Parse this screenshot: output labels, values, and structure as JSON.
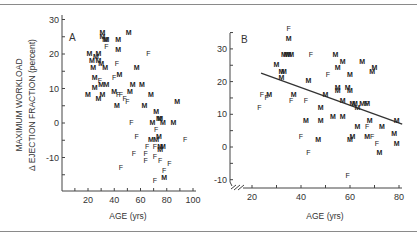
{
  "chart_data": [
    {
      "type": "scatter",
      "panel": "A",
      "xlabel": "AGE (yrs)",
      "ylabel": "MAXIMUM WORKLOAD Δ EJECTION FRACTION (percent)",
      "xlim": [
        0,
        100
      ],
      "ylim": [
        -20,
        30
      ],
      "xticks": [
        20,
        40,
        60,
        80,
        100
      ],
      "yticks": [
        30,
        20,
        10,
        0,
        -10
      ],
      "grid": false,
      "legend": "point markers: M = male, F = female",
      "series": [
        {
          "name": "M",
          "points": [
            [
              31,
              26
            ],
            [
              31,
              25
            ],
            [
              33,
              24
            ],
            [
              34,
              24
            ],
            [
              43,
              24
            ],
            [
              51,
              26
            ],
            [
              21,
              20
            ],
            [
              28,
              20
            ],
            [
              43,
              21
            ],
            [
              23,
              18
            ],
            [
              26,
              19
            ],
            [
              28,
              18
            ],
            [
              30,
              17
            ],
            [
              24,
              16
            ],
            [
              33,
              16
            ],
            [
              25,
              13
            ],
            [
              57,
              16
            ],
            [
              44,
              14
            ],
            [
              30,
              11
            ],
            [
              34,
              11
            ],
            [
              25,
              10
            ],
            [
              20,
              8
            ],
            [
              28,
              7
            ],
            [
              31,
              8
            ],
            [
              54,
              11
            ],
            [
              61,
              11
            ],
            [
              52,
              9
            ],
            [
              40,
              9
            ],
            [
              42,
              5
            ],
            [
              63,
              5
            ],
            [
              68,
              8
            ],
            [
              88,
              6
            ],
            [
              72,
              3
            ],
            [
              74,
              1
            ],
            [
              75,
              1
            ],
            [
              69,
              0
            ],
            [
              77,
              0
            ],
            [
              85,
              0
            ],
            [
              74,
              -4
            ],
            [
              68,
              -5
            ],
            [
              72,
              -5
            ],
            [
              75,
              -7
            ],
            [
              77,
              -7
            ],
            [
              75,
              -8
            ],
            [
              78,
              -16
            ]
          ]
        },
        {
          "name": "F",
          "points": [
            [
              34,
              22
            ],
            [
              66,
              20
            ],
            [
              42,
              17
            ],
            [
              40,
              13
            ],
            [
              29,
              12
            ],
            [
              43,
              8
            ],
            [
              45,
              8
            ],
            [
              48,
              7
            ],
            [
              50,
              6
            ],
            [
              53,
              0
            ],
            [
              72,
              -2
            ],
            [
              57,
              -4
            ],
            [
              94,
              -5
            ],
            [
              65,
              -7
            ],
            [
              71,
              -7
            ],
            [
              55,
              -9
            ],
            [
              64,
              -9
            ],
            [
              71,
              -10
            ],
            [
              64,
              -11
            ],
            [
              75,
              -11
            ],
            [
              82,
              -12
            ],
            [
              45,
              -13
            ],
            [
              78,
              -14
            ],
            [
              71,
              -17
            ]
          ]
        }
      ],
      "annotations": [
        "A"
      ]
    },
    {
      "type": "scatter",
      "panel": "B",
      "xlabel": "AGE (yrs)",
      "ylabel": "",
      "xlim": [
        10,
        80
      ],
      "ylim": [
        -10,
        35
      ],
      "xticks": [
        20,
        40,
        60,
        80
      ],
      "yticks": [
        30,
        20,
        10,
        0,
        -10
      ],
      "grid": false,
      "axis_break": true,
      "series": [
        {
          "name": "M",
          "points": [
            [
              35,
              33
            ],
            [
              33,
              28
            ],
            [
              34,
              28
            ],
            [
              35,
              28
            ],
            [
              36,
              28
            ],
            [
              30,
              25
            ],
            [
              32,
              23
            ],
            [
              33,
              23
            ],
            [
              32,
              21
            ],
            [
              37,
              16
            ],
            [
              27,
              16
            ],
            [
              43,
              20
            ],
            [
              54,
              28
            ],
            [
              55,
              24
            ],
            [
              57,
              26
            ],
            [
              65,
              26
            ],
            [
              70,
              24
            ],
            [
              69,
              23
            ],
            [
              60,
              22
            ],
            [
              50,
              16
            ],
            [
              55,
              18
            ],
            [
              55,
              17
            ],
            [
              59,
              18
            ],
            [
              60,
              17
            ],
            [
              57,
              14
            ],
            [
              61,
              13
            ],
            [
              62,
              13
            ],
            [
              63,
              12
            ],
            [
              65,
              13
            ],
            [
              67,
              13
            ],
            [
              42,
              8
            ],
            [
              48,
              12
            ],
            [
              48,
              8
            ],
            [
              53,
              9
            ],
            [
              57,
              9
            ],
            [
              68,
              8
            ],
            [
              79,
              8
            ],
            [
              63,
              6
            ],
            [
              73,
              6
            ],
            [
              61,
              3
            ],
            [
              60,
              2
            ],
            [
              67,
              3
            ],
            [
              78,
              4
            ],
            [
              47,
              2
            ],
            [
              79,
              1
            ],
            [
              72,
              -2
            ]
          ]
        },
        {
          "name": "F",
          "points": [
            [
              35,
              36
            ],
            [
              44,
              28
            ],
            [
              24,
              16
            ],
            [
              26,
              15
            ],
            [
              23,
              12
            ],
            [
              36,
              14
            ],
            [
              42,
              14
            ],
            [
              51,
              22
            ],
            [
              67,
              13
            ],
            [
              67,
              6
            ],
            [
              69,
              3
            ],
            [
              71,
              1
            ],
            [
              40,
              3
            ],
            [
              43,
              -2
            ],
            [
              59,
              -9
            ]
          ]
        }
      ],
      "regression_line": [
        [
          23.7,
          22.6
        ],
        [
          81.3,
          7.0
        ]
      ],
      "annotations": [
        "B"
      ]
    }
  ],
  "labels": {
    "panel_a": "A",
    "panel_b": "B",
    "ylabel_line1": "MAXIMUM WORKLOAD",
    "ylabel_line2": "Δ EJECTION FRACTION (percent)",
    "xlabel_a": "AGE (yrs)",
    "xlabel_b": "AGE (yrs)",
    "axis_break_glyph": "⁄⁄"
  },
  "colors": {
    "ink": "#222222",
    "frame": "#8a8a8a",
    "background": "#ffffff"
  }
}
